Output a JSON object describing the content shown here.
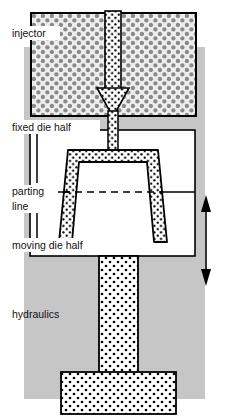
{
  "figure": {
    "type": "technical-cross-section-diagram",
    "width": 225,
    "height": 417,
    "background_color": "#ffffff",
    "machine_body_color": "#c6c6c6",
    "outline_color": "#000000",
    "die_cavity_fill": "#ffffff"
  },
  "labels": {
    "injector": "injector",
    "fixed_die_half": "fixed die half",
    "parting_line_1": "parting",
    "parting_line_2": "line",
    "moving_die_half": "moving die half",
    "hydraulics": "hydraulics"
  },
  "components": {
    "injector_block": {
      "name": "injector",
      "fill_pattern": "gray-circle-hatch",
      "pattern_color": "#8a8a8a",
      "pattern_background": "#ededed"
    },
    "melt_arrow": {
      "name": "melt-flow-arrow",
      "direction": "down",
      "fill_pattern": "black-dot-hatch",
      "pattern_background": "#ffffff"
    },
    "sprue": {
      "name": "sprue-channel",
      "fill_pattern": "black-dot-hatch"
    },
    "moulded_part": {
      "name": "moulded-part-cavity",
      "shape": "open-cup-with-draft-angle",
      "fill_pattern": "black-dot-hatch"
    },
    "ejector_ram": {
      "name": "hydraulic-ram",
      "shape": "inverted-T",
      "fill_pattern": "black-dot-hatch"
    },
    "motion_arrow": {
      "name": "die-motion-arrow",
      "direction": "up-down",
      "style": "double-headed"
    },
    "parting_line": {
      "name": "parting-line",
      "style": "dashed"
    }
  }
}
